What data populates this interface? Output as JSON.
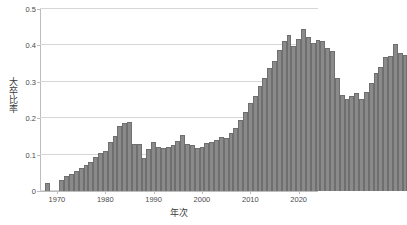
{
  "chart_data": {
    "type": "bar",
    "title": "",
    "xlabel": "年次",
    "ylabel": "大卒比率",
    "xlim": [
      1966.5,
      2024.0
    ],
    "ylim": [
      0,
      0.5
    ],
    "grid": true,
    "grid_axis": "y",
    "legend": false,
    "bar_color": "#8a8a8a",
    "bar_edge_color": "#6f6f6f",
    "background_color": "#ffffff",
    "gridline_color": "#d6d6d6",
    "axis_color": "#bdbdbd",
    "yticks": [
      "0",
      "0.1",
      "0.2",
      "0.3",
      "0.4",
      "0.5"
    ],
    "ytick_values": [
      0,
      0.1,
      0.2,
      0.3,
      0.4,
      0.5
    ],
    "xticks": [
      "1970",
      "1980",
      "1990",
      "2000",
      "2010",
      "2020"
    ],
    "xtick_values": [
      1970,
      1980,
      1990,
      2000,
      2010,
      2020
    ],
    "x": [
      1968,
      1971,
      1972,
      1973,
      1974,
      1975,
      1976,
      1977,
      1978,
      1979,
      1980,
      1981,
      1982,
      1983,
      1984,
      1985,
      1986,
      1987,
      1988,
      1989,
      1990,
      1991,
      1992,
      1993,
      1994,
      1995,
      1996,
      1997,
      1998,
      1999,
      2000,
      2001,
      2002,
      2003,
      2004,
      2005,
      2006,
      2007,
      2008,
      2009,
      2010,
      2011,
      2012,
      2013,
      2014,
      2015,
      2016,
      2017,
      2018,
      2019,
      2020,
      2021,
      2022,
      2023
    ],
    "values": [
      0.022,
      0.03,
      0.04,
      0.048,
      0.055,
      0.063,
      0.072,
      0.08,
      0.093,
      0.105,
      0.11,
      0.135,
      0.152,
      0.178,
      0.188,
      0.19,
      0.129,
      0.128,
      0.091,
      0.115,
      0.135,
      0.12,
      0.118,
      0.122,
      0.126,
      0.138,
      0.154,
      0.128,
      0.126,
      0.117,
      0.12,
      0.132,
      0.136,
      0.141,
      0.148,
      0.146,
      0.16,
      0.172,
      0.196,
      0.216,
      0.242,
      0.262,
      0.288,
      0.31,
      0.338,
      0.358,
      0.388,
      0.412,
      0.428,
      0.398,
      0.418,
      0.445,
      0.422,
      0.408
    ],
    "values_continued": [
      0.415,
      0.413,
      0.392,
      0.385,
      0.31,
      0.265,
      0.252,
      0.262,
      0.268,
      0.252,
      0.272,
      0.298,
      0.325,
      0.34,
      0.368,
      0.372,
      0.404,
      0.378,
      0.374
    ],
    "series_note": "大卒比率 by 年次"
  },
  "axes": {
    "y_title": "大卒比率",
    "x_title": "年次"
  }
}
